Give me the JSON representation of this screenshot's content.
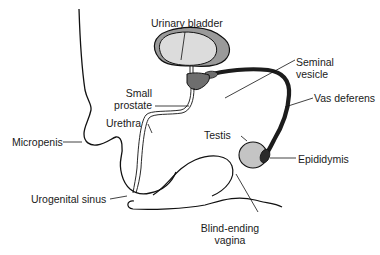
{
  "diagram": {
    "type": "anatomical-illustration",
    "colors": {
      "outline": "#111111",
      "bladder_wall": "#9a9a9a",
      "bladder_lumen": "#dcdcdc",
      "prostate": "#6e6e6e",
      "vas_deferens": "#1c1c1c",
      "testis": "#c4c4c4",
      "epididymis": "#2a2a2a",
      "background": "#ffffff"
    },
    "labels": {
      "urinary_bladder": "Urinary bladder",
      "seminal_vesicle_line1": "Seminal",
      "seminal_vesicle_line2": "vesicle",
      "small_prostate_line1": "Small",
      "small_prostate_line2": "prostate",
      "vas_deferens": "Vas deferens",
      "urethra": "Urethra",
      "micropenis": "Micropenis",
      "testis": "Testis",
      "epididymis": "Epididymis",
      "urogenital_sinus": "Urogenital sinus",
      "blind_ending_vagina_line1": "Blind-ending",
      "blind_ending_vagina_line2": "vagina"
    }
  }
}
